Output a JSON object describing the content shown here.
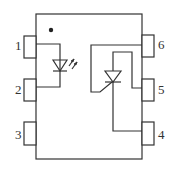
{
  "diagram": {
    "type": "optocoupler-package",
    "pin1_marker": "dot",
    "pins": [
      {
        "number": "1",
        "side": "left"
      },
      {
        "number": "2",
        "side": "left"
      },
      {
        "number": "3",
        "side": "left"
      },
      {
        "number": "6",
        "side": "right"
      },
      {
        "number": "5",
        "side": "right"
      },
      {
        "number": "4",
        "side": "right"
      }
    ],
    "components": [
      {
        "name": "led",
        "icon": "led-icon",
        "connected_pins": [
          "1",
          "2"
        ]
      },
      {
        "name": "scr",
        "icon": "thyristor-icon",
        "connected_pins": [
          "6",
          "5",
          "4"
        ]
      }
    ],
    "colors": {
      "line": "#333333",
      "background": "#ffffff"
    }
  }
}
